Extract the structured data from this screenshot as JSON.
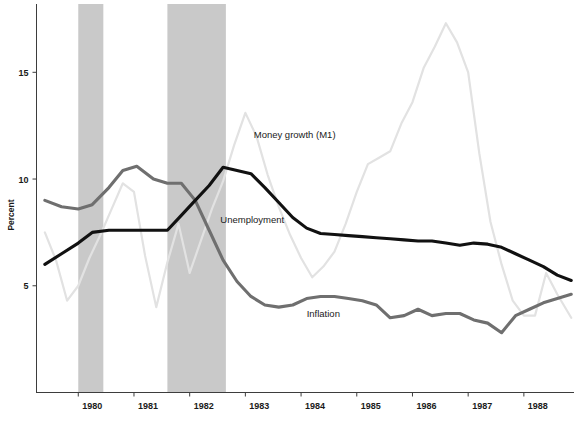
{
  "chart_data": {
    "type": "line",
    "title": "",
    "xlabel": "",
    "ylabel": "Percent",
    "xlim": [
      1979.25,
      1988.9
    ],
    "ylim": [
      0,
      18.2
    ],
    "grid": false,
    "legend_position": "inline-annotations",
    "xticks": [
      "1980",
      "1981",
      "1982",
      "1983",
      "1984",
      "1985",
      "1986",
      "1987",
      "1988"
    ],
    "xtick_values": [
      1980,
      1981,
      1982,
      1983,
      1984,
      1985,
      1986,
      1987,
      1988
    ],
    "yticks": [
      "5",
      "10",
      "15"
    ],
    "ytick_values": [
      5,
      10,
      15
    ],
    "annotations": [
      {
        "text": "Money growth (M1)",
        "x": 1983.15,
        "y": 11.9
      },
      {
        "text": "Unemployment",
        "x": 1982.55,
        "y": 7.95
      },
      {
        "text": "Inflation",
        "x": 1984.1,
        "y": 3.55
      }
    ],
    "shaded_regions": [
      {
        "name": "recession-1980",
        "x0": 1980.0,
        "x1": 1980.45,
        "label": "1980 recession"
      },
      {
        "name": "recession-1981-82",
        "x0": 1981.6,
        "x1": 1982.65,
        "label": "1981-82 recession"
      }
    ],
    "series": [
      {
        "name": "Unemployment",
        "color": "#111111",
        "width": 3.1,
        "x": [
          1979.4,
          1979.7,
          1980.0,
          1980.25,
          1980.55,
          1980.8,
          1981.05,
          1981.35,
          1981.6,
          1981.85,
          1982.1,
          1982.35,
          1982.6,
          1982.85,
          1983.1,
          1983.35,
          1983.6,
          1983.85,
          1984.1,
          1984.35,
          1984.6,
          1984.85,
          1985.1,
          1985.35,
          1985.6,
          1985.85,
          1986.1,
          1986.35,
          1986.6,
          1986.85,
          1987.1,
          1987.35,
          1987.6,
          1987.85,
          1988.1,
          1988.35,
          1988.6,
          1988.85
        ],
        "values": [
          6.0,
          6.5,
          7.0,
          7.5,
          7.6,
          7.6,
          7.6,
          7.6,
          7.6,
          8.3,
          9.0,
          9.7,
          10.55,
          10.4,
          10.25,
          9.6,
          8.9,
          8.2,
          7.7,
          7.45,
          7.4,
          7.35,
          7.3,
          7.25,
          7.2,
          7.15,
          7.1,
          7.1,
          7.0,
          6.9,
          7.0,
          6.95,
          6.8,
          6.5,
          6.2,
          5.9,
          5.5,
          5.25
        ]
      },
      {
        "name": "Inflation",
        "color": "#6f6f6f",
        "width": 3.1,
        "x": [
          1979.4,
          1979.7,
          1980.0,
          1980.25,
          1980.55,
          1980.8,
          1981.05,
          1981.35,
          1981.6,
          1981.85,
          1982.1,
          1982.35,
          1982.6,
          1982.85,
          1983.1,
          1983.35,
          1983.6,
          1983.85,
          1984.1,
          1984.35,
          1984.6,
          1984.85,
          1985.1,
          1985.35,
          1985.6,
          1985.85,
          1986.1,
          1986.35,
          1986.6,
          1986.85,
          1987.1,
          1987.35,
          1987.6,
          1987.85,
          1988.1,
          1988.35,
          1988.6,
          1988.85
        ],
        "values": [
          9.0,
          8.7,
          8.6,
          8.8,
          9.6,
          10.4,
          10.6,
          10.0,
          9.8,
          9.8,
          9.0,
          7.6,
          6.2,
          5.2,
          4.5,
          4.1,
          4.0,
          4.1,
          4.4,
          4.5,
          4.5,
          4.4,
          4.3,
          4.1,
          3.5,
          3.6,
          3.9,
          3.6,
          3.7,
          3.7,
          3.4,
          3.25,
          2.8,
          3.6,
          3.9,
          4.2,
          4.4,
          4.6
        ]
      },
      {
        "name": "Money growth (M1)",
        "color": "#e2e2e2",
        "width": 2.2,
        "x": [
          1979.4,
          1979.6,
          1979.8,
          1980.0,
          1980.2,
          1980.4,
          1980.6,
          1980.8,
          1981.0,
          1981.2,
          1981.4,
          1981.6,
          1981.8,
          1982.0,
          1982.2,
          1982.4,
          1982.6,
          1982.8,
          1983.0,
          1983.2,
          1983.4,
          1983.6,
          1983.8,
          1984.0,
          1984.2,
          1984.4,
          1984.6,
          1984.8,
          1985.0,
          1985.2,
          1985.4,
          1985.6,
          1985.8,
          1986.0,
          1986.2,
          1986.4,
          1986.6,
          1986.8,
          1987.0,
          1987.2,
          1987.4,
          1987.6,
          1987.8,
          1988.0,
          1988.2,
          1988.4,
          1988.6,
          1988.85
        ],
        "values": [
          7.5,
          6.2,
          4.3,
          5.0,
          6.3,
          7.4,
          8.6,
          9.8,
          9.4,
          6.4,
          4.0,
          6.1,
          7.9,
          5.6,
          7.1,
          8.6,
          9.9,
          11.6,
          13.1,
          12.0,
          10.2,
          8.7,
          7.4,
          6.3,
          5.4,
          5.9,
          6.6,
          7.9,
          9.4,
          10.7,
          11.0,
          11.3,
          12.6,
          13.6,
          15.2,
          16.2,
          17.3,
          16.4,
          15.0,
          11.2,
          8.0,
          6.0,
          4.3,
          3.6,
          3.6,
          5.6,
          4.6,
          3.5
        ]
      }
    ]
  },
  "axes": {
    "y_axis_title": "Percent"
  }
}
